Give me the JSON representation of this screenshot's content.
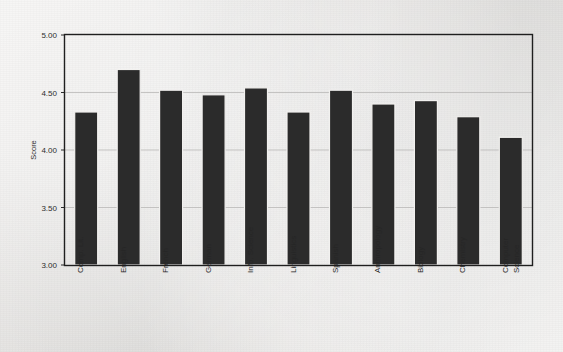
{
  "chart_data": {
    "type": "bar",
    "title": "",
    "subtitle": "",
    "xlabel": "",
    "ylabel": "Score",
    "ylim": [
      3.0,
      5.0
    ],
    "ytick_step": 0.5,
    "ytick_labels": [
      "5.00",
      "4.50",
      "4.00",
      "3.50",
      "3.00"
    ],
    "ytick_values": [
      5.0,
      4.5,
      4.0,
      3.5,
      3.0
    ],
    "grid": "horizontal",
    "legend": "none",
    "bar_color": "#2b2b2b",
    "frame_color": "#1f1f1f",
    "background_color": "#e8e8e6",
    "categories": [
      "Comp. Lit.",
      "English",
      "French",
      "German",
      "Info. Science",
      "Linguistics",
      "Spanish",
      "Anthropology",
      "Biology",
      "Chemistry",
      "Computer Science"
    ],
    "values": [
      4.33,
      4.7,
      4.52,
      4.48,
      4.54,
      4.33,
      4.52,
      4.4,
      4.43,
      4.29,
      4.11
    ]
  }
}
